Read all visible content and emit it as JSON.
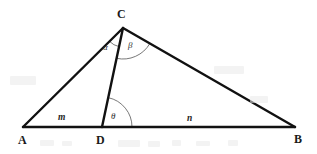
{
  "figure": {
    "kind": "geometry-diagram",
    "background_color": "#ffffff",
    "stroke_color": "#111111",
    "arc_color": "#555555",
    "side_stroke_width": 2.4,
    "arc_stroke_width": 0.8
  },
  "vertices": [
    {
      "id": "A",
      "label": "A",
      "x": 23,
      "y": 127,
      "label_x": 18,
      "label_y": 134
    },
    {
      "id": "B",
      "label": "B",
      "x": 295,
      "y": 127,
      "label_x": 294,
      "label_y": 133
    },
    {
      "id": "C",
      "label": "C",
      "x": 123,
      "y": 28,
      "label_x": 117,
      "label_y": 8
    },
    {
      "id": "D",
      "label": "D",
      "x": 102,
      "y": 127,
      "label_x": 96,
      "label_y": 134
    }
  ],
  "segments": [
    {
      "id": "AC",
      "from": "A",
      "to": "C"
    },
    {
      "id": "CB",
      "from": "C",
      "to": "B"
    },
    {
      "id": "AB",
      "from": "A",
      "to": "B"
    },
    {
      "id": "CD",
      "from": "C",
      "to": "D"
    }
  ],
  "side_labels": [
    {
      "id": "m",
      "label": "m",
      "segment": "AD",
      "x": 58,
      "y": 113
    },
    {
      "id": "n",
      "label": "n",
      "segment": "DB",
      "x": 187,
      "y": 114
    }
  ],
  "angles": [
    {
      "id": "alpha",
      "label": "α",
      "vertex": "C",
      "between": [
        "CA",
        "CD"
      ],
      "radius": 19,
      "label_x": 103,
      "label_y": 43
    },
    {
      "id": "beta",
      "label": "β",
      "vertex": "C",
      "between": [
        "CD",
        "CB"
      ],
      "radius": 31,
      "label_x": 128,
      "label_y": 41
    },
    {
      "id": "theta",
      "label": "θ",
      "vertex": "D",
      "between": [
        "DB",
        "DC"
      ],
      "radius": 30,
      "label_x": 111,
      "label_y": 112
    }
  ],
  "artifacts": [
    {
      "x": 40,
      "y": 140,
      "w": 14,
      "h": 6
    },
    {
      "x": 62,
      "y": 141,
      "w": 10,
      "h": 5
    },
    {
      "x": 118,
      "y": 140,
      "w": 22,
      "h": 7
    },
    {
      "x": 148,
      "y": 141,
      "w": 12,
      "h": 6
    },
    {
      "x": 172,
      "y": 140,
      "w": 9,
      "h": 6
    },
    {
      "x": 196,
      "y": 141,
      "w": 14,
      "h": 5
    },
    {
      "x": 228,
      "y": 140,
      "w": 10,
      "h": 6
    },
    {
      "x": 10,
      "y": 76,
      "w": 26,
      "h": 9
    },
    {
      "x": 214,
      "y": 66,
      "w": 30,
      "h": 8
    },
    {
      "x": 250,
      "y": 96,
      "w": 18,
      "h": 7
    }
  ]
}
